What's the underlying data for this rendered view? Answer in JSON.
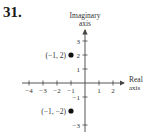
{
  "problem_number": "31.",
  "chart_data": {
    "type": "scatter",
    "title": "",
    "xlabel": "Real axis",
    "ylabel": "Imaginary axis",
    "xlabel_lines": [
      "Real",
      "axis"
    ],
    "ylabel_lines": [
      "Imaginary",
      "axis"
    ],
    "x_ticks": [
      -4,
      -3,
      -2,
      -1,
      1,
      2
    ],
    "x_tick_labels": [
      "−4",
      "−3",
      "−2",
      "−1",
      "1",
      "2"
    ],
    "y_ticks": [
      3,
      2,
      1,
      -1,
      -3
    ],
    "y_tick_labels": [
      "3",
      "2",
      "1",
      "−1",
      "−3"
    ],
    "xlim": [
      -4.5,
      2.8
    ],
    "ylim": [
      -3.4,
      3.8
    ],
    "grid": false,
    "legend": null,
    "points": [
      {
        "x": -1,
        "y": 2,
        "label": "(−1, 2)"
      },
      {
        "x": -1,
        "y": -2,
        "label": "(−1, −2)"
      }
    ],
    "point_color": "#111111",
    "axis_color": "#444444"
  }
}
